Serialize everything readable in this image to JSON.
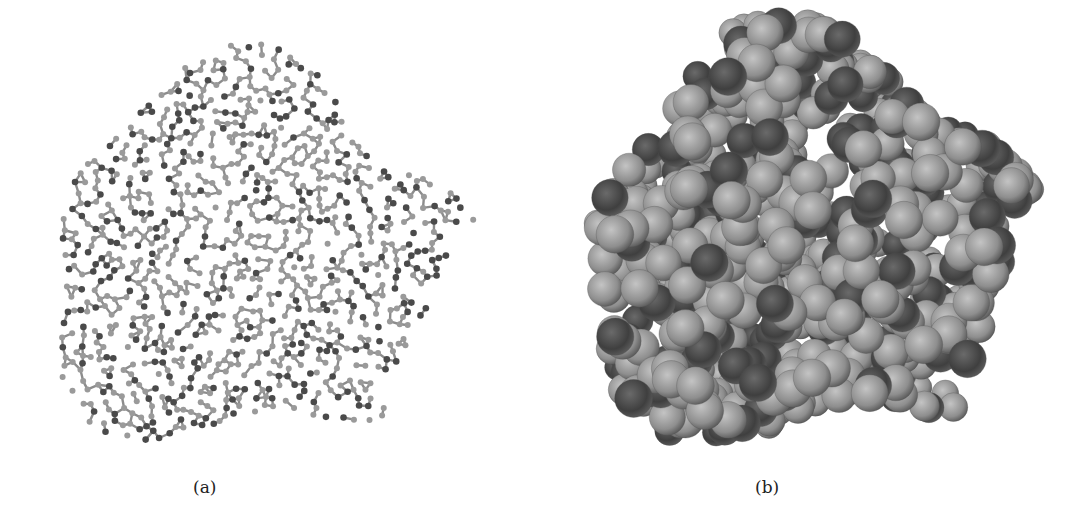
{
  "figure": {
    "panels": [
      {
        "id": "a",
        "label": "(a)",
        "representation": "ball-and-stick",
        "atom_colors": {
          "light": "#9a9a9a",
          "dark": "#4a4a4a",
          "bond": "#8c8c8c"
        }
      },
      {
        "id": "b",
        "label": "(b)",
        "representation": "space-filling",
        "atom_colors": {
          "light": "#8e8e8e",
          "dark": "#3f3f3f",
          "highlight": "#c4c4c4",
          "shadow": "#5a5a5a"
        }
      }
    ],
    "background": "#ffffff"
  }
}
